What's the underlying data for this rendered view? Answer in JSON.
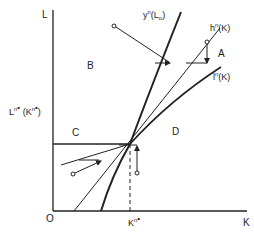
{
  "axes": {
    "y_label": "L",
    "x_label": "K",
    "origin_label": "O",
    "x_tick_label": "Kn*",
    "y_tick_label": "Ln*(Kn*)"
  },
  "curves": {
    "y_curve": "yn(L0)",
    "h_curve": "hn(K)",
    "l_curve": "ln(K)"
  },
  "regions": {
    "a": "A",
    "b": "B",
    "c": "C",
    "d": "D"
  },
  "colors": {
    "ink": "#222222",
    "background": "#ffffff"
  }
}
